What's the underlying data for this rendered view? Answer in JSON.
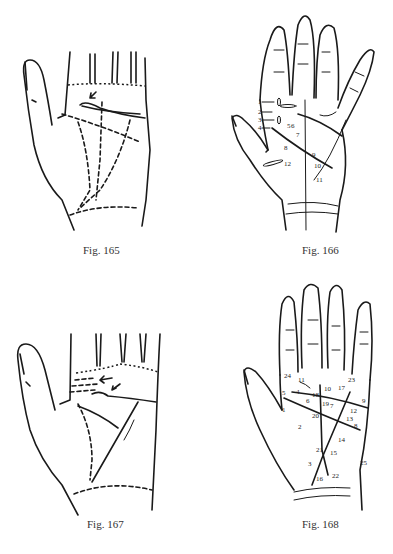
{
  "figures": [
    {
      "id": "fig165",
      "caption": "Fig. 165"
    },
    {
      "id": "fig166",
      "caption": "Fig. 166",
      "markers": [
        "1",
        "2",
        "3",
        "4",
        "5",
        "6",
        "7",
        "8",
        "9",
        "10",
        "11",
        "12"
      ]
    },
    {
      "id": "fig167",
      "caption": "Fig. 167"
    },
    {
      "id": "fig168",
      "caption": "Fig. 168",
      "markers": [
        "1",
        "2",
        "3",
        "4",
        "5",
        "6",
        "7",
        "8",
        "9",
        "10",
        "11",
        "12",
        "13",
        "14",
        "15",
        "16",
        "17",
        "18",
        "19",
        "20",
        "21",
        "22",
        "23",
        "24",
        "25"
      ]
    }
  ]
}
